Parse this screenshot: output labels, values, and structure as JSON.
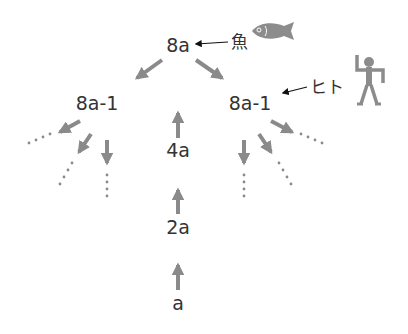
{
  "nodes": {
    "top": "8a",
    "left_child": "8a-1",
    "right_child": "8a-1",
    "level2": "4a",
    "level1": "2a",
    "root": "a"
  },
  "annotations": {
    "fish_label": "魚",
    "human_label": "ヒト"
  },
  "icons": {
    "fish": "fish-icon",
    "human": "human-figure-icon"
  },
  "colors": {
    "arrow": "#8a8a8a",
    "text": "#333333",
    "pointer": "#111111",
    "icon": "#8c8c8c"
  }
}
